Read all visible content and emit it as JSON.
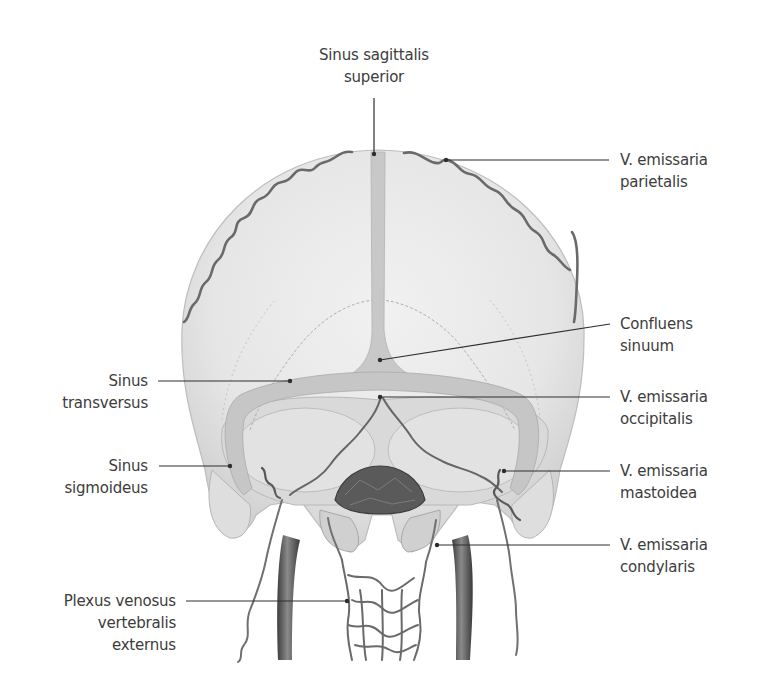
{
  "figure": {
    "colors": {
      "bone": "#e9e9e9",
      "bone_shadow": "#cfcfcf",
      "sinus": "#c4c4c4",
      "vein": "#6d6d6d",
      "vein_dark": "#4a4a4a",
      "leader_line": "#2e2e2e",
      "text": "#3c3c3c",
      "background": "#ffffff"
    }
  },
  "labels": {
    "sinus_sagittalis_superior": {
      "line1": "Sinus sagittalis",
      "line2": "superior"
    },
    "v_emissaria_parietalis": {
      "line1": "V. emissaria",
      "line2": "parietalis"
    },
    "confluens_sinuum": {
      "line1": "Confluens",
      "line2": "sinuum"
    },
    "v_emissaria_occipitalis": {
      "line1": "V. emissaria",
      "line2": "occipitalis"
    },
    "v_emissaria_mastoidea": {
      "line1": "V. emissaria",
      "line2": "mastoidea"
    },
    "v_emissaria_condylaris": {
      "line1": "V. emissaria",
      "line2": "condylaris"
    },
    "sinus_transversus": {
      "line1": "Sinus",
      "line2": "transversus"
    },
    "sinus_sigmoideus": {
      "line1": "Sinus",
      "line2": "sigmoideus"
    },
    "plexus_venosus_vertebralis_externus": {
      "line1": "Plexus venosus",
      "line2": "vertebralis",
      "line3": "externus"
    }
  }
}
